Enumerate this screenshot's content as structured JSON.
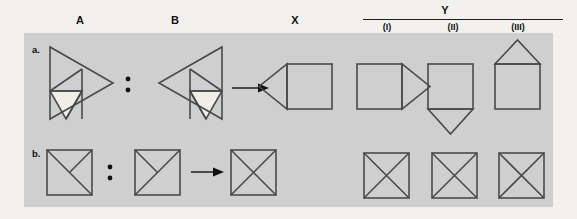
{
  "figure": {
    "background_color": "#f2f1ee",
    "panel_color": "#cfcfcf",
    "line_color": "#4a4a4a",
    "fill_color": "#efeee9"
  },
  "header": {
    "columns": [
      {
        "id": "A",
        "label": "A"
      },
      {
        "id": "B",
        "label": "B"
      },
      {
        "id": "X",
        "label": "X"
      },
      {
        "id": "Y",
        "label": "Y"
      }
    ],
    "y_group_label": "Y",
    "y_options": [
      {
        "id": "I",
        "label": "(I)"
      },
      {
        "id": "II",
        "label": "(II)"
      },
      {
        "id": "III",
        "label": "(III)"
      }
    ]
  },
  "rows": [
    {
      "id": "a",
      "label": "a.",
      "relation_symbol": ":",
      "arrow_symbol": "→",
      "items": {
        "A": "right-pointing-triangle-subdivided-white-lower-left",
        "B": "left-pointing-triangle-subdivided-white-lower-right",
        "X": "square-with-left-triangle",
        "Y": [
          "square-with-right-triangle",
          "square-with-bottom-triangle",
          "square-with-top-triangle"
        ]
      }
    },
    {
      "id": "b",
      "label": "b.",
      "relation_symbol": ":",
      "arrow_symbol": "→",
      "items": {
        "A": "square-with-full-diagonal-tl-br-and-half-diagonal-tr-center",
        "B": "square-with-full-diagonal-bl-tr-and-half-diagonal-tl-center",
        "X": "square-with-full-x",
        "Y": [
          "square-with-full-x",
          "square-with-full-x",
          "square-with-full-x"
        ]
      }
    }
  ]
}
